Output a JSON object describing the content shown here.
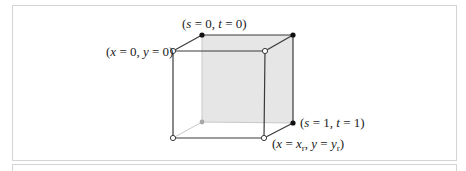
{
  "figure": {
    "labels": {
      "top_back": {
        "pre": "(",
        "v1": "s",
        "eq1": " = 0, ",
        "v2": "t",
        "eq2": " = 0)"
      },
      "top_front": {
        "pre": "(",
        "v1": "x",
        "eq1": " = 0, ",
        "v2": "y",
        "eq2": " = 0)"
      },
      "bottom_back": {
        "pre": "(",
        "v1": "s",
        "eq1": " = 1, ",
        "v2": "t",
        "eq2": " = 1)"
      },
      "bottom_front": {
        "pre": "(",
        "v1": "x",
        "eq1": " = ",
        "v1b": "x",
        "sub1": "r",
        "mid": ", ",
        "v2": "y",
        "eq2": " = ",
        "v2b": "y",
        "sub2": "r",
        "post": ")"
      }
    },
    "colors": {
      "edge": "#3a3a3a",
      "hidden_edge": "#c8c8c8",
      "shaded_face": "#e6e6e6",
      "filled_vertex": "#111111",
      "open_vertex": "#ffffff",
      "hidden_vertex": "#a8a8a8"
    }
  }
}
